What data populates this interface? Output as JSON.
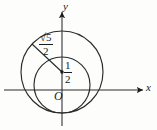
{
  "figure": {
    "name": "two-overlapping-circles-coordinate-diagram",
    "axes": {
      "y_label": "y",
      "x_label": "x",
      "origin_label": "O"
    },
    "labels": {
      "radius": {
        "numerator": "√5",
        "denominator": "2"
      },
      "center_offset": {
        "numerator": "1",
        "denominator": "2"
      }
    },
    "colors": {
      "ink": "#1a1a1a",
      "background": "#fdfdfc",
      "curve": "#2b2b2b"
    },
    "geometry": {
      "origin": {
        "x": 62,
        "y": 90
      },
      "center_point": {
        "x": 62,
        "y": 72
      },
      "big_circle": {
        "cx": 62,
        "cy": 72,
        "r": 41
      },
      "small_circle": {
        "cx": 62,
        "cy": 85,
        "r": 28
      },
      "radius_line": {
        "x1": 62,
        "y1": 72,
        "x2": 32,
        "y2": 45
      },
      "x_axis": {
        "x1": 4,
        "y1": 90,
        "x2": 145,
        "y2": 90
      },
      "y_axis": {
        "x1": 62,
        "y1": 125,
        "x2": 62,
        "y2": 10
      }
    }
  }
}
